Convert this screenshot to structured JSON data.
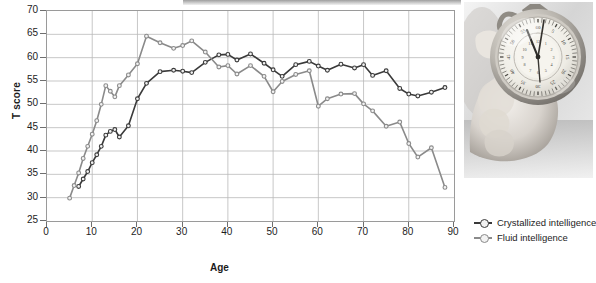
{
  "figure": {
    "photo_alt": "hand-holding-stopwatch-photo"
  },
  "legend": {
    "position": "right-bottom",
    "items": [
      {
        "label": "Crystallized intelligence",
        "color": "#3a3a3a",
        "icon": "line-marker-icon"
      },
      {
        "label": "Fluid intelligence",
        "color": "#8a8a8a",
        "icon": "line-marker-icon"
      }
    ]
  },
  "chart_data": {
    "type": "line",
    "title": "",
    "subtitle": "",
    "xlabel": "Age",
    "ylabel": "T score",
    "xlim": [
      0,
      90
    ],
    "ylim": [
      25,
      70
    ],
    "xticks": [
      0,
      10,
      20,
      30,
      40,
      50,
      60,
      70,
      80,
      90
    ],
    "yticks": [
      25,
      30,
      35,
      40,
      45,
      50,
      55,
      60,
      65,
      70
    ],
    "grid": true,
    "annotations": [],
    "series": [
      {
        "name": "Crystallized intelligence",
        "color": "#3a3a3a",
        "marker": "circle",
        "x": [
          7,
          8,
          9,
          10,
          11,
          12,
          13,
          14,
          15,
          16,
          18,
          20,
          22,
          25,
          28,
          30,
          32,
          35,
          38,
          40,
          42,
          45,
          48,
          50,
          52,
          55,
          58,
          60,
          62,
          65,
          68,
          70,
          72,
          75,
          78,
          80,
          82,
          85,
          88
        ],
        "y": [
          32.4,
          34.0,
          35.6,
          37.5,
          39.2,
          41.0,
          43.4,
          44.2,
          44.6,
          43.0,
          45.4,
          51.2,
          54.5,
          57.0,
          57.3,
          57.1,
          56.8,
          59.0,
          60.6,
          60.7,
          59.5,
          60.8,
          58.8,
          57.4,
          56.0,
          58.5,
          59.2,
          58.2,
          57.3,
          58.6,
          57.8,
          58.5,
          56.2,
          57.2,
          53.4,
          52.2,
          51.8,
          52.6,
          53.6
        ]
      },
      {
        "name": "Fluid intelligence",
        "color": "#8a8a8a",
        "marker": "circle",
        "x": [
          5,
          6,
          7,
          8,
          9,
          10,
          11,
          12,
          13,
          14,
          15,
          16,
          18,
          20,
          22,
          25,
          28,
          30,
          32,
          35,
          38,
          40,
          42,
          45,
          48,
          50,
          52,
          55,
          58,
          60,
          62,
          65,
          68,
          70,
          72,
          75,
          78,
          80,
          82,
          85,
          88
        ],
        "y": [
          29.9,
          32.6,
          35.3,
          38.4,
          41.0,
          43.6,
          46.5,
          50.0,
          54.0,
          52.8,
          51.6,
          54.0,
          56.3,
          58.7,
          64.6,
          63.2,
          62.0,
          62.6,
          63.6,
          61.2,
          58.0,
          58.3,
          56.5,
          58.3,
          56.0,
          52.7,
          54.9,
          56.4,
          57.2,
          49.6,
          51.2,
          52.2,
          52.3,
          50.1,
          48.6,
          45.3,
          46.2,
          41.6,
          38.7,
          40.7,
          32.2
        ]
      }
    ]
  }
}
